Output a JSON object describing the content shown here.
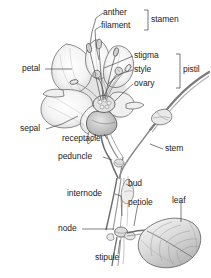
{
  "diagram": {
    "style": "grayscale pencil botanical illustration with leader-line callouts",
    "background_color": "#ffffff",
    "ink_color": "#232323",
    "pencil_gray": "#8c8c8c",
    "shade_gray": "#c9c9c9"
  },
  "labels": {
    "anther": "anther",
    "filament": "filament",
    "stamen": "stamen",
    "petal": "petal",
    "stigma": "stigma",
    "style": "style",
    "ovary": "ovary",
    "pistil": "pistil",
    "sepal": "sepal",
    "receptacle": "receptacle",
    "peduncle": "peduncle",
    "stem": "stem",
    "bud": "bud",
    "internode": "internode",
    "petiole": "petiole",
    "leaf": "leaf",
    "node": "node",
    "stipule": "stipule"
  },
  "groups": {
    "stamen_members": [
      "anther",
      "filament"
    ],
    "pistil_members": [
      "stigma",
      "style",
      "ovary"
    ]
  },
  "parts": [
    {
      "name": "anther",
      "label": "anther",
      "group": "stamen"
    },
    {
      "name": "filament",
      "label": "filament",
      "group": "stamen"
    },
    {
      "name": "stigma",
      "label": "stigma",
      "group": "pistil"
    },
    {
      "name": "style",
      "label": "style",
      "group": "pistil"
    },
    {
      "name": "ovary",
      "label": "ovary",
      "group": "pistil"
    },
    {
      "name": "petal",
      "label": "petal",
      "group": "perianth"
    },
    {
      "name": "sepal",
      "label": "sepal",
      "group": "perianth"
    },
    {
      "name": "receptacle",
      "label": "receptacle",
      "group": "axis"
    },
    {
      "name": "peduncle",
      "label": "peduncle",
      "group": "axis"
    },
    {
      "name": "stem",
      "label": "stem",
      "group": "axis"
    },
    {
      "name": "bud",
      "label": "bud",
      "group": "shoot"
    },
    {
      "name": "internode",
      "label": "internode",
      "group": "shoot"
    },
    {
      "name": "node",
      "label": "node",
      "group": "shoot"
    },
    {
      "name": "petiole",
      "label": "petiole",
      "group": "leaf"
    },
    {
      "name": "leaf",
      "label": "leaf",
      "group": "leaf"
    },
    {
      "name": "stipule",
      "label": "stipule",
      "group": "leaf"
    }
  ]
}
